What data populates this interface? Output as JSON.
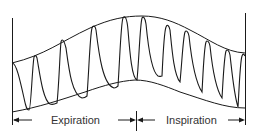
{
  "diagram": {
    "labels": {
      "expiration": "Expiration",
      "inspiration": "Inspiration"
    },
    "colors": {
      "stroke": "#1a1a1a",
      "text": "#333333",
      "background": "#ffffff"
    },
    "phases": [
      {
        "name": "Expiration",
        "direction": "left"
      },
      {
        "name": "Inspiration",
        "direction": "right"
      }
    ],
    "beats": 11
  }
}
